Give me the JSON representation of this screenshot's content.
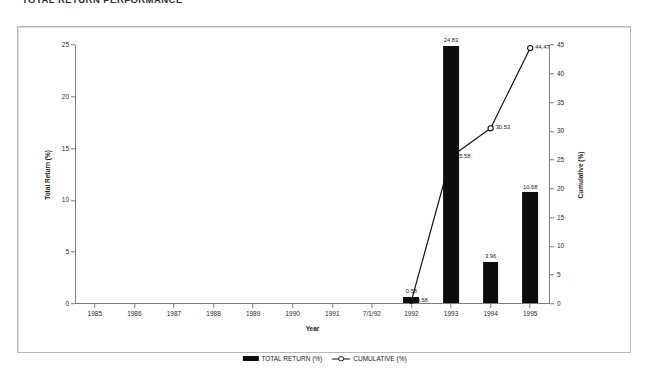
{
  "document": {
    "title": "TOTAL RETURN PERFORMANCE"
  },
  "chart_data": {
    "type": "bar",
    "title": "TOTAL RETURN PERFORMANCE",
    "xlabel": "Year",
    "ylabel": "Total Return (%)",
    "y2label": "Cumulative (%)",
    "categories": [
      "1985",
      "1986",
      "1987",
      "1988",
      "1989",
      "1990",
      "1991",
      "7/1/92",
      "1992",
      "1993",
      "1994",
      "1995"
    ],
    "ylim": [
      0,
      25
    ],
    "y2lim": [
      0,
      45
    ],
    "yticks": [
      "0",
      "5",
      "10",
      "15",
      "20",
      "25"
    ],
    "y2ticks": [
      "0",
      "5",
      "10",
      "15",
      "20",
      "25",
      "30",
      "35",
      "40",
      "45"
    ],
    "grid": false,
    "legend_position": "bottom-center",
    "series": [
      {
        "name": "TOTAL RETURN (%)",
        "type": "bar",
        "axis": "left",
        "color": "#0d0d0d",
        "values": [
          null,
          null,
          null,
          null,
          null,
          null,
          null,
          null,
          0.58,
          24.83,
          3.96,
          10.68
        ],
        "labels": [
          "",
          "",
          "",
          "",
          "",
          "",
          "",
          "",
          "0.58",
          "24.83",
          "3.96",
          "10.68"
        ]
      },
      {
        "name": "CUMULATIVE (%)",
        "type": "line",
        "axis": "right",
        "color": "#111111",
        "marker": "open-circle",
        "values": [
          null,
          null,
          null,
          null,
          null,
          null,
          null,
          null,
          0.58,
          25.58,
          30.53,
          44.47
        ],
        "labels": [
          "",
          "",
          "",
          "",
          "",
          "",
          "",
          "",
          "0.58",
          "25.58",
          "30.53",
          "44.47"
        ]
      }
    ]
  },
  "legend": {
    "items": [
      {
        "label": "TOTAL RETURN (%)",
        "marker": "bar-swatch-icon"
      },
      {
        "label": "CUMULATIVE (%)",
        "marker": "line-circle-marker-icon"
      }
    ]
  }
}
